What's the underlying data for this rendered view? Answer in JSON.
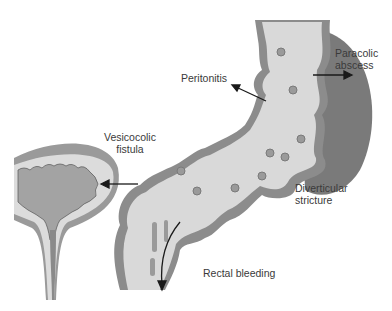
{
  "labels": {
    "paracolic_abscess": [
      "Paracolic",
      "abscess"
    ],
    "peritonitis": "Peritonitis",
    "vesicocolic_fistula": [
      "Vesicocolic",
      "fistula"
    ],
    "diverticular_stricture": [
      "Diverticular",
      "stricture"
    ],
    "rectal_bleeding": "Rectal bleeding"
  },
  "colors": {
    "colon_lumen": "#d9d9d9",
    "colon_wall": "#8c8c8c",
    "abscess": "#7a7a7a",
    "bladder_outer": "#9a9a9a",
    "bladder_inner": "#dcdcdc",
    "bladder_mucosa": "#a3a3a3",
    "arrow": "#1a1a1a",
    "text": "#3a3a3a"
  }
}
